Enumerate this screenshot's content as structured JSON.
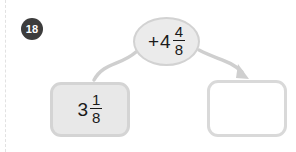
{
  "problem": {
    "number": "18",
    "type": "function-machine"
  },
  "input_box": {
    "whole": "3",
    "numerator": "1",
    "denominator": "8",
    "value_text": "3 1/8",
    "filled": true
  },
  "operator": {
    "symbol": "+",
    "whole": "4",
    "numerator": "4",
    "denominator": "8",
    "value_text": "+4 4/8"
  },
  "output_box": {
    "value_text": "",
    "placeholder": "",
    "filled": false
  },
  "colors": {
    "badge_bg": "#3c3c3c",
    "badge_text": "#ffffff",
    "box_fill": "#e8e8e8",
    "box_border": "#d4d4d4",
    "empty_box_fill": "#ffffff",
    "empty_box_border": "#d9d9d9",
    "oval_fill": "#ebebeb",
    "oval_border": "#d2d2d2",
    "arrow": "#cfcfcf",
    "text": "#1a1a1a",
    "page_bg": "#ffffff",
    "margin_rule": "#e2e2e2"
  },
  "icons": {
    "input_connector": "curved-line",
    "output_connector": "curved-arrow"
  }
}
